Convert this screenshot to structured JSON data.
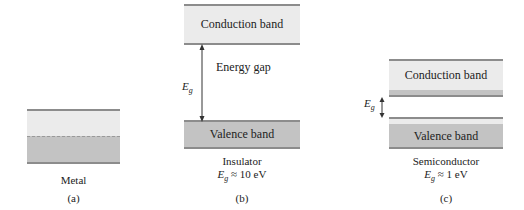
{
  "panels": {
    "a": {
      "name": "Metal",
      "tag": "(a)"
    },
    "b": {
      "name": "Insulator",
      "gap_value": "≈ 10 eV",
      "conduction_label": "Conduction band",
      "valence_label": "Valence band",
      "gap_label": "Energy gap",
      "eg_label": "E",
      "eg_sub": "g",
      "tag": "(b)"
    },
    "c": {
      "name": "Semiconductor",
      "gap_value": "≈ 1 eV",
      "conduction_label": "Conduction band",
      "valence_label": "Valence band",
      "eg_label": "E",
      "eg_sub": "g",
      "tag": "(c)"
    }
  },
  "colors": {
    "band_light": "#ebebeb",
    "band_dark": "#c3c3c3",
    "band_edge": "#8c8c8c"
  }
}
